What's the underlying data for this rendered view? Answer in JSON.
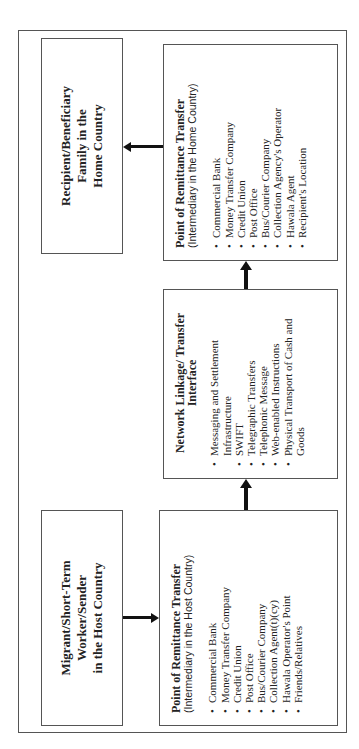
{
  "diagram": {
    "nodes": {
      "sender": {
        "lines": [
          "Migrant/Short-Term",
          "Worker/Sender",
          "in the Host Country"
        ]
      },
      "host_point": {
        "title": "Point of Remittance Transfer",
        "subtitle": "(Intermediary in the Host Country)",
        "items": [
          "Commercial Bank",
          "Money Transfer Company",
          "Credit Union",
          "Post Office",
          "Bus/Courier Company",
          "Collection Agent(t)(cy)",
          "Hawala Operator's Point",
          "Friends/Relatives"
        ]
      },
      "network": {
        "title": "Network Linkage/ Transfer Interface",
        "items": [
          "Messaging and Settlement Infrastructure",
          "SWIFT",
          "Telegraphic Transfers",
          "Telephonic Message",
          "Web-enabled Instructions",
          "Physical Transport of Cash and Goods"
        ]
      },
      "home_point": {
        "title": "Point of Remittance Transfer",
        "subtitle": "(Intermediary in the Home Country)",
        "items": [
          "Commercial Bank",
          "Money Transfer Company",
          "Credit Union",
          "Post Office",
          "Bus/Courier Company",
          "Collection Agency's Operator",
          "Hawala Agent",
          "Recipient's Location"
        ]
      },
      "recipient": {
        "lines": [
          "Recipient/Beneficiary",
          "Family in the",
          "Home Country"
        ]
      }
    },
    "edges": [
      {
        "from": "sender",
        "to": "host_point"
      },
      {
        "from": "host_point",
        "to": "network"
      },
      {
        "from": "network",
        "to": "home_point"
      },
      {
        "from": "home_point",
        "to": "recipient"
      }
    ],
    "orientation": "rotated -90deg (reads bottom-to-top)"
  }
}
